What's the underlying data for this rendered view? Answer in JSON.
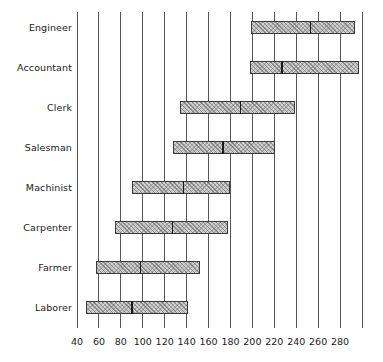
{
  "chart_data": {
    "type": "bar",
    "subtype": "range-bar-with-median",
    "title": "",
    "subtitle": "",
    "xlabel": "",
    "ylabel": "",
    "xlim": [
      40,
      300
    ],
    "xticks": [
      40,
      60,
      80,
      100,
      120,
      140,
      160,
      180,
      200,
      220,
      240,
      260,
      280
    ],
    "xtick_labels": [
      "40",
      "60",
      "80",
      "100",
      "120",
      "140",
      "160",
      "180",
      "200",
      "220",
      "240",
      "260",
      "280"
    ],
    "grid": "vertical",
    "gridlines_at": [
      40,
      60,
      80,
      100,
      120,
      140,
      160,
      180,
      200,
      220,
      240,
      260,
      280,
      300
    ],
    "legend": "none",
    "categories": [
      "Engineer",
      "Accountant",
      "Clerk",
      "Salesman",
      "Machinist",
      "Carpenter",
      "Farmer",
      "Laborer"
    ],
    "series": [
      {
        "name": "range",
        "bars": [
          {
            "category": "Engineer",
            "low": 199,
            "high": 294,
            "median": 253
          },
          {
            "category": "Accountant",
            "low": 198,
            "high": 297,
            "median": 227
          },
          {
            "category": "Clerk",
            "low": 134,
            "high": 239,
            "median": 189
          },
          {
            "category": "Salesman",
            "low": 128,
            "high": 221,
            "median": 173
          },
          {
            "category": "Machinist",
            "low": 90,
            "high": 180,
            "median": 137
          },
          {
            "category": "Carpenter",
            "low": 75,
            "high": 178,
            "median": 127
          },
          {
            "category": "Farmer",
            "low": 57,
            "high": 152,
            "median": 98
          },
          {
            "category": "Laborer",
            "low": 48,
            "high": 141,
            "median": 90
          }
        ]
      }
    ],
    "colors": {
      "bar_fill": "#cfcfcf",
      "bar_hatch": "#5a5a5a",
      "bar_border": "#3a3a3a",
      "median_marker": "#1a1a1a",
      "gridline": "#555555",
      "text": "#1a1a1a",
      "background": "#ffffff"
    }
  },
  "layout": {
    "plot_left_px": 77,
    "plot_right_px": 362,
    "plot_top_px": 12,
    "plot_bottom_px": 328,
    "row_height_px": 40,
    "row_first_top_px": 8
  }
}
